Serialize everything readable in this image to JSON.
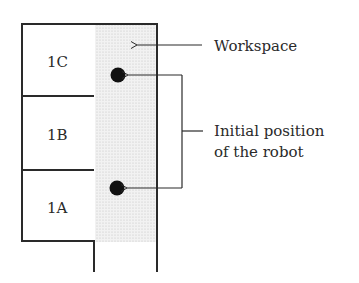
{
  "diagram": {
    "rooms": [
      {
        "id": "1C",
        "label": "1C"
      },
      {
        "id": "1B",
        "label": "1B"
      },
      {
        "id": "1A",
        "label": "1A"
      }
    ],
    "annotations": {
      "workspace": "Workspace",
      "initial_position_line1": "Initial position",
      "initial_position_line2": "of the robot"
    },
    "robot_positions": [
      {
        "room": "1C",
        "x": 118,
        "y": 75
      },
      {
        "room": "1A",
        "x": 118,
        "y": 188
      }
    ],
    "colors": {
      "line": "#2a2a2a",
      "workspace_fill": "#e6e6e6",
      "robot": "#111111"
    }
  }
}
